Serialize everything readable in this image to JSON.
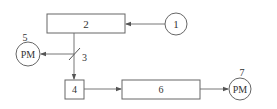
{
  "diagram": {
    "nodes": [
      {
        "id": "1",
        "label": "1",
        "shape": "circle"
      },
      {
        "id": "2",
        "label": "2",
        "shape": "rect"
      },
      {
        "id": "3",
        "label": "3",
        "shape": "slash-marker"
      },
      {
        "id": "4",
        "label": "4",
        "shape": "rect"
      },
      {
        "id": "5",
        "label": "PM",
        "number": "5",
        "shape": "circle"
      },
      {
        "id": "6",
        "label": "6",
        "shape": "rect"
      },
      {
        "id": "7",
        "label": "PM",
        "number": "7",
        "shape": "circle"
      }
    ],
    "edges": [
      {
        "from": "1",
        "to": "2"
      },
      {
        "from": "2",
        "to": "4",
        "via": "3"
      },
      {
        "from": "3",
        "to": "5"
      },
      {
        "from": "4",
        "to": "6"
      },
      {
        "from": "6",
        "to": "7"
      }
    ],
    "colors": {
      "stroke": "#555555",
      "text": "#333333",
      "background": "#ffffff"
    }
  }
}
